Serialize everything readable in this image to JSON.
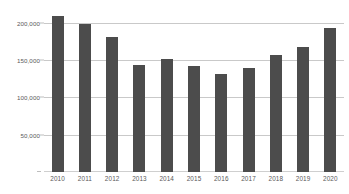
{
  "chart_data": {
    "type": "bar",
    "title": "",
    "subtitle": "",
    "xlabel": "",
    "ylabel": "",
    "categories": [
      "2010",
      "2011",
      "2012",
      "2013",
      "2014",
      "2015",
      "2016",
      "2017",
      "2018",
      "2019",
      "2020"
    ],
    "values": [
      209000,
      198000,
      181000,
      143000,
      152000,
      142000,
      131000,
      140000,
      157000,
      168000,
      193000
    ],
    "series": [
      {
        "name": "",
        "values": [
          209000,
          198000,
          181000,
          143000,
          152000,
          142000,
          131000,
          140000,
          157000,
          168000,
          193000
        ]
      }
    ],
    "ylim": [
      0,
      212000
    ],
    "ytick_values": [
      50000,
      100000,
      150000,
      200000
    ],
    "ytick_labels": [
      "50,000",
      "100,000",
      "150,000",
      "200,000"
    ],
    "xtick_labels": [
      "2010",
      "2011",
      "2012",
      "2013",
      "2014",
      "2015",
      "2016",
      "2017",
      "2018",
      "2019",
      "2020"
    ],
    "grid": "horizontal",
    "legend": "none",
    "annotations": [],
    "colors": {
      "bar": "#4c4c4c",
      "gridline": "#c9c9c9",
      "axis_text": "#595959",
      "background": "#ffffff"
    }
  }
}
